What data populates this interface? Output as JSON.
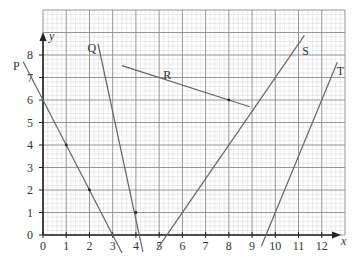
{
  "chart_data": {
    "type": "line",
    "title": "",
    "xlabel": "x",
    "ylabel": "y",
    "xlim": [
      0,
      13
    ],
    "ylim": [
      0,
      10
    ],
    "grid": true,
    "grid_minor_divisions": 5,
    "x_ticks": [
      "0",
      "1",
      "2",
      "3",
      "4",
      "5",
      "6",
      "7",
      "8",
      "9",
      "10",
      "11",
      "12"
    ],
    "y_ticks": [
      "0",
      "1",
      "2",
      "3",
      "4",
      "5",
      "6",
      "7",
      "8"
    ],
    "series": [
      {
        "name": "P",
        "points": [
          [
            -0.85,
            7.7
          ],
          [
            0,
            6
          ],
          [
            1,
            4
          ],
          [
            2,
            2
          ],
          [
            3,
            0
          ],
          [
            3.4,
            -0.8
          ]
        ],
        "marked_points": [
          [
            1,
            4
          ],
          [
            2,
            2
          ]
        ]
      },
      {
        "name": "Q",
        "points": [
          [
            2.37,
            8.5
          ],
          [
            4,
            1
          ],
          [
            4.3,
            -0.75
          ]
        ],
        "marked_points": [
          [
            4,
            1
          ]
        ]
      },
      {
        "name": "R",
        "points": [
          [
            3.4,
            7.53
          ],
          [
            8,
            6
          ],
          [
            8.9,
            5.7
          ]
        ],
        "marked_points": [
          [
            8,
            6
          ]
        ]
      },
      {
        "name": "S",
        "points": [
          [
            4.9,
            -0.65
          ],
          [
            8,
            4
          ],
          [
            10,
            7
          ],
          [
            11.25,
            8.875
          ]
        ],
        "marked_points": []
      },
      {
        "name": "T",
        "points": [
          [
            9.4,
            -0.5
          ],
          [
            10,
            1
          ],
          [
            11,
            3.5
          ],
          [
            12,
            6
          ],
          [
            12.67,
            7.68
          ]
        ],
        "marked_points": []
      }
    ],
    "labels": [
      {
        "text": "P",
        "x": -1.15,
        "y": 7.5
      },
      {
        "text": "Q",
        "x": 2.1,
        "y": 8.3
      },
      {
        "text": "R",
        "x": 5.35,
        "y": 7.1
      },
      {
        "text": "S",
        "x": 11.3,
        "y": 8.2
      },
      {
        "text": "T",
        "x": 12.8,
        "y": 7.3
      }
    ]
  },
  "axes": {
    "x_label": "x",
    "y_label": "y"
  },
  "colors": {
    "minor_grid": "#d6d6d6",
    "major_grid": "#8a8a8a",
    "axis": "#222222",
    "line": "#666666",
    "text": "#333333"
  }
}
